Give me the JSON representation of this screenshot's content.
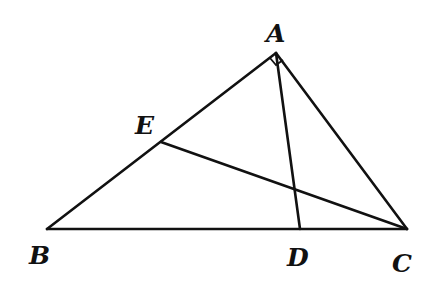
{
  "diagram": {
    "type": "geometry",
    "points": {
      "A": {
        "label": "A",
        "x": 276,
        "y": 53
      },
      "B": {
        "label": "B",
        "x": 47,
        "y": 229
      },
      "C": {
        "label": "C",
        "x": 407,
        "y": 229
      },
      "D": {
        "label": "D",
        "x": 300,
        "y": 229
      },
      "E": {
        "label": "E",
        "x": 161,
        "y": 142
      }
    },
    "segments": [
      "AB",
      "AC",
      "BC",
      "AD",
      "CE"
    ],
    "right_angle_at": "A",
    "labels": {
      "A": "A",
      "B": "B",
      "C": "C",
      "D": "D",
      "E": "E"
    }
  }
}
